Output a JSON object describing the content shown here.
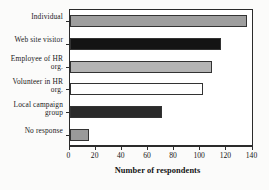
{
  "chart_data": {
    "type": "bar",
    "orientation": "horizontal",
    "title": "",
    "xlabel": "Number of respondents",
    "ylabel": "",
    "xlim": [
      0,
      140
    ],
    "xticks": [
      0,
      20,
      40,
      60,
      80,
      100,
      120,
      140
    ],
    "grid": false,
    "legend": "none",
    "categories": [
      "Individual",
      "Web site visitor",
      "Employee of  HR\norg.",
      "Volunteer in HR\norg.",
      "Local campaign\ngroup",
      "No response"
    ],
    "category_lines": [
      [
        "Individual"
      ],
      [
        "Web site visitor"
      ],
      [
        "Employee of  HR",
        "org."
      ],
      [
        "Volunteer in HR",
        "org."
      ],
      [
        "Local campaign",
        "group"
      ],
      [
        "No response"
      ]
    ],
    "values": [
      136,
      116,
      109,
      102,
      71,
      15
    ],
    "bar_colors": [
      "#9e9e9e",
      "#141414",
      "#b4b4b4",
      "#ffffff",
      "#2a2a2a",
      "#9a9a9a"
    ],
    "bar_edge_color": "#333333",
    "axis_color": "#2b2b2b",
    "background": "#ffffff"
  },
  "axis": {
    "x_title": "Number of respondents"
  }
}
